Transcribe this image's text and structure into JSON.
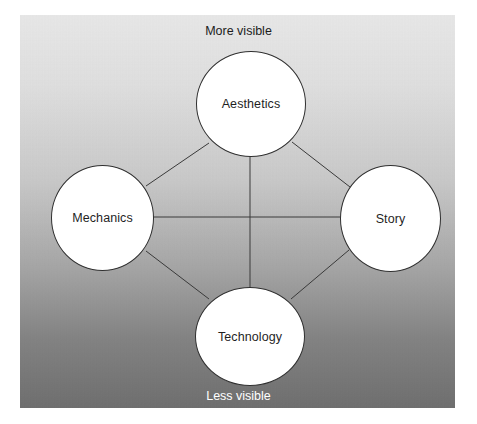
{
  "diagram": {
    "type": "network-diagram",
    "background": {
      "gradient_from": "#e9e9e9",
      "gradient_to": "#6d6d6d",
      "panel_border": "none"
    },
    "axis_captions": {
      "top": "More visible",
      "bottom": "Less visible",
      "top_color": "#1c1c1c",
      "bottom_color": "#ffffff"
    },
    "nodes": [
      {
        "id": "aesthetics",
        "label": "Aesthetics",
        "position": "top"
      },
      {
        "id": "mechanics",
        "label": "Mechanics",
        "position": "left"
      },
      {
        "id": "story",
        "label": "Story",
        "position": "right"
      },
      {
        "id": "technology",
        "label": "Technology",
        "position": "bottom"
      }
    ],
    "node_style": {
      "fill": "#ffffff",
      "stroke": "#2f2f2f",
      "text_color": "#1f1f1f"
    },
    "edges": [
      {
        "id": "edge-mechanics-aesthetics",
        "from": "mechanics",
        "to": "aesthetics"
      },
      {
        "id": "edge-aesthetics-story",
        "from": "aesthetics",
        "to": "story"
      },
      {
        "id": "edge-mechanics-story",
        "from": "mechanics",
        "to": "story"
      },
      {
        "id": "edge-aesthetics-technology",
        "from": "aesthetics",
        "to": "technology"
      },
      {
        "id": "edge-mechanics-technology",
        "from": "mechanics",
        "to": "technology"
      },
      {
        "id": "edge-story-technology",
        "from": "story",
        "to": "technology"
      }
    ],
    "edge_style": {
      "stroke": "#3a3a3a",
      "width": 1
    }
  }
}
